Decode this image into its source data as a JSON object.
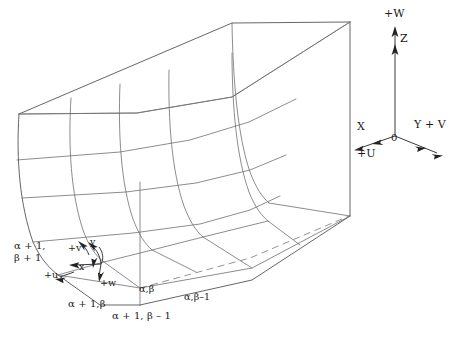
{
  "figure": {
    "background_color": "#ffffff",
    "mesh_line_color": "#6e6e72",
    "axis_line_color": "#3a3a3f",
    "text_color": "#1a1a1a"
  },
  "global_axes": {
    "origin_label": "0",
    "vertical_axis_label": "+W",
    "vertical_secondary_label": "Z",
    "right_axis_label": "Y + V",
    "left_axis_label": "X",
    "left_axis_secondary_label": "+U"
  },
  "local_axes": {
    "x_label": "x",
    "y_label": "y",
    "u_label": "+u",
    "v_label": "+v",
    "w_label": "+w"
  },
  "node_labels": {
    "alpha_plus_1_beta_plus_1_line1": "α + 1,",
    "alpha_plus_1_beta_plus_1_line2": "β + 1",
    "alpha_plus_1_beta": "α + 1,β",
    "alpha_plus_1_beta_minus_1": "α + 1, β – 1",
    "alpha_beta": "α,β",
    "alpha_beta_minus_1": "α,β–1"
  }
}
